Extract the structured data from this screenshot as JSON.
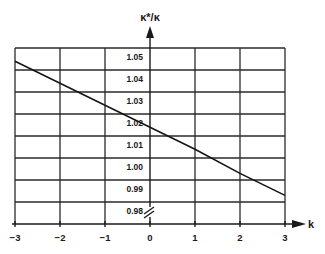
{
  "chart_data": {
    "type": "line",
    "title": "",
    "xlabel": "k",
    "ylabel": "κ*/κ",
    "xlim": [
      -3,
      3
    ],
    "ylim": [
      0.98,
      1.05
    ],
    "grid": true,
    "legend": null,
    "x_ticks": [
      "−3",
      "−2",
      "−1",
      "0",
      "1",
      "2",
      "3"
    ],
    "y_ticks": [
      "1.05",
      "1.04",
      "1.03",
      "1.02",
      "1.01",
      "1.00",
      "0.99",
      "0.98"
    ],
    "y_tick_values": [
      1.05,
      1.04,
      1.03,
      1.02,
      1.01,
      1.0,
      0.99,
      0.98
    ],
    "annotations": [
      "axis break marks (//) on vertical axis below 0.98"
    ],
    "series": [
      {
        "name": "κ*/κ",
        "x": [
          -3,
          -2,
          -1,
          0,
          1,
          2,
          3
        ],
        "values": [
          1.044,
          1.034,
          1.024,
          1.014,
          1.004,
          0.993,
          0.983
        ]
      }
    ]
  }
}
